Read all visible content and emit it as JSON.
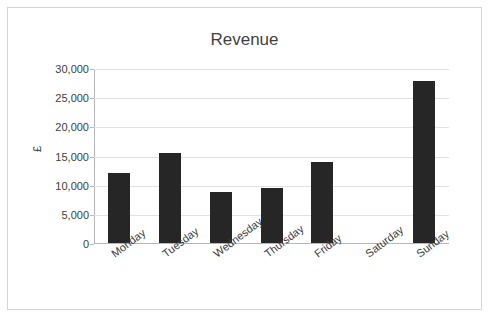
{
  "chart_data": {
    "type": "bar",
    "title": "Revenue",
    "xlabel": "",
    "ylabel": "£",
    "categories": [
      "Monday",
      "Tuesday",
      "Wednesday",
      "Thursday",
      "Friday",
      "Saturday",
      "Sunday"
    ],
    "values": [
      12000,
      15400,
      8700,
      9400,
      13900,
      0,
      27700
    ],
    "ylim": [
      0,
      30000
    ],
    "yticks": [
      0,
      5000,
      10000,
      15000,
      20000,
      25000,
      30000
    ],
    "ytick_labels": [
      "0",
      "5,000",
      "10,000",
      "15,000",
      "20,000",
      "25,000",
      "30,000"
    ],
    "grid": true,
    "legend": false,
    "bar_color": "#262626",
    "gridline_color": "#e2e2e2",
    "axis_color": "#b7b7b7",
    "border_color": "#d4d4d4",
    "title_color": "#3f3f3f",
    "label_color": "#404040"
  }
}
